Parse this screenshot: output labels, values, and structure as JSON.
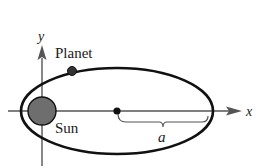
{
  "diagram": {
    "type": "elliptical-orbit",
    "labels": {
      "y_axis": "y",
      "x_axis": "x",
      "planet": "Planet",
      "sun": "Sun",
      "semi_major_axis": "a"
    },
    "colors": {
      "ink": "#1a1a1a",
      "axis": "#555555",
      "sun_fill": "#6e6e6e",
      "planet_fill": "#333333",
      "background": "#ffffff"
    }
  }
}
